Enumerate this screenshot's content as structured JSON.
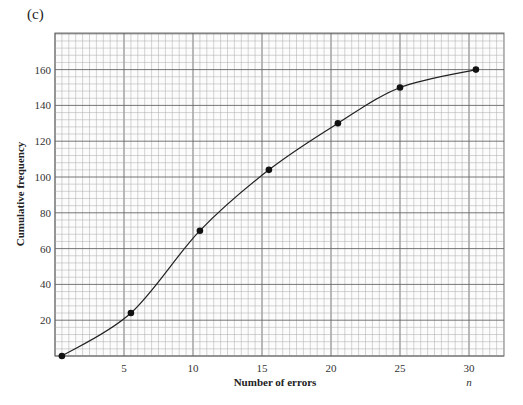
{
  "part_label": "(c)",
  "chart_data": {
    "type": "line",
    "title": "",
    "xlabel": "Number of errors",
    "x_variable": "n",
    "ylabel": "Cumulative frequency",
    "xlim": [
      0,
      32.5
    ],
    "ylim": [
      0,
      180
    ],
    "x_ticks": [
      5,
      10,
      15,
      20,
      25,
      30
    ],
    "y_ticks": [
      20,
      40,
      60,
      80,
      100,
      120,
      140,
      160
    ],
    "grid": true,
    "legend": null,
    "series": [
      {
        "name": "Cumulative frequency",
        "style": "smooth curve with point markers",
        "points": [
          {
            "x": 0.5,
            "y": 0
          },
          {
            "x": 5.5,
            "y": 24
          },
          {
            "x": 10.5,
            "y": 70
          },
          {
            "x": 15.5,
            "y": 104
          },
          {
            "x": 20.5,
            "y": 130
          },
          {
            "x": 25,
            "y": 150
          },
          {
            "x": 30.5,
            "y": 160
          }
        ]
      }
    ]
  }
}
